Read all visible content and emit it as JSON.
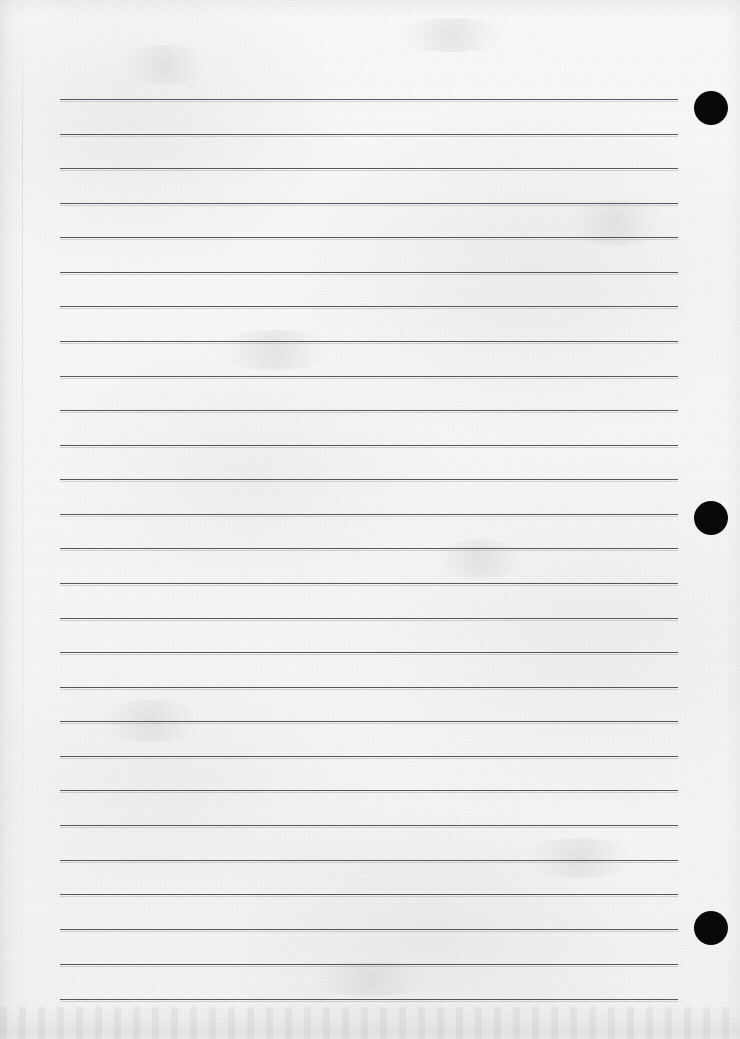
{
  "document": {
    "type": "scanned-ruled-notebook-page",
    "title": "Blank Ruled Page",
    "page_width": 740,
    "page_height": 1039,
    "has_text_content": false,
    "content_text": "",
    "paper_color": "#f6f6f4",
    "rule_color": "#474a50",
    "marker_color": "#080808",
    "background_color": "#ffffff"
  },
  "ruling": {
    "label": "Ruled writing lines",
    "line_count": 27,
    "first_line_y": 99,
    "line_spacing": 34.6,
    "line_left_x": 60,
    "line_right_x": 678,
    "line_thickness": 1.4,
    "lines": [
      {
        "index": 1,
        "y": 99,
        "x1": 60,
        "x2": 678
      },
      {
        "index": 2,
        "y": 134,
        "x1": 60,
        "x2": 678
      },
      {
        "index": 3,
        "y": 168,
        "x1": 60,
        "x2": 678
      },
      {
        "index": 4,
        "y": 203,
        "x1": 60,
        "x2": 678
      },
      {
        "index": 5,
        "y": 237,
        "x1": 60,
        "x2": 678
      },
      {
        "index": 6,
        "y": 272,
        "x1": 60,
        "x2": 678
      },
      {
        "index": 7,
        "y": 306,
        "x1": 60,
        "x2": 678
      },
      {
        "index": 8,
        "y": 341,
        "x1": 60,
        "x2": 678
      },
      {
        "index": 9,
        "y": 376,
        "x1": 60,
        "x2": 678
      },
      {
        "index": 10,
        "y": 410,
        "x1": 60,
        "x2": 678
      },
      {
        "index": 11,
        "y": 445,
        "x1": 60,
        "x2": 678
      },
      {
        "index": 12,
        "y": 479,
        "x1": 60,
        "x2": 678
      },
      {
        "index": 13,
        "y": 514,
        "x1": 60,
        "x2": 678
      },
      {
        "index": 14,
        "y": 548,
        "x1": 60,
        "x2": 678
      },
      {
        "index": 15,
        "y": 583,
        "x1": 60,
        "x2": 678
      },
      {
        "index": 16,
        "y": 618,
        "x1": 60,
        "x2": 678
      },
      {
        "index": 17,
        "y": 652,
        "x1": 60,
        "x2": 678
      },
      {
        "index": 18,
        "y": 687,
        "x1": 60,
        "x2": 678
      },
      {
        "index": 19,
        "y": 721,
        "x1": 60,
        "x2": 678
      },
      {
        "index": 20,
        "y": 756,
        "x1": 60,
        "x2": 678
      },
      {
        "index": 21,
        "y": 790,
        "x1": 60,
        "x2": 678
      },
      {
        "index": 22,
        "y": 825,
        "x1": 60,
        "x2": 678
      },
      {
        "index": 23,
        "y": 860,
        "x1": 60,
        "x2": 678
      },
      {
        "index": 24,
        "y": 894,
        "x1": 60,
        "x2": 678
      },
      {
        "index": 25,
        "y": 929,
        "x1": 60,
        "x2": 678
      },
      {
        "index": 26,
        "y": 964,
        "x1": 60,
        "x2": 678
      },
      {
        "index": 27,
        "y": 999,
        "x1": 60,
        "x2": 678
      }
    ]
  },
  "markers": {
    "label": "Black binder hole marks",
    "count": 3,
    "radius": 17,
    "color": "#080808",
    "dots": [
      {
        "index": 1,
        "cx": 711,
        "cy": 108,
        "r": 17
      },
      {
        "index": 2,
        "cx": 711,
        "cy": 518,
        "r": 17
      },
      {
        "index": 3,
        "cx": 711,
        "cy": 928,
        "r": 17
      }
    ]
  },
  "artifacts": {
    "label": "Scan artifacts",
    "left_edge_shadow": true,
    "left_crease_x": 22,
    "top_edge_shadow": true,
    "bottom_dirty_band": true,
    "bottom_band_height": 32,
    "smudges": [
      {
        "x": 120,
        "y": 45,
        "w": 90,
        "h": 40
      },
      {
        "x": 392,
        "y": 18,
        "w": 120,
        "h": 34
      },
      {
        "x": 560,
        "y": 200,
        "w": 110,
        "h": 46
      },
      {
        "x": 210,
        "y": 330,
        "w": 130,
        "h": 40
      },
      {
        "x": 430,
        "y": 540,
        "w": 100,
        "h": 38
      },
      {
        "x": 96,
        "y": 700,
        "w": 110,
        "h": 42
      },
      {
        "x": 520,
        "y": 838,
        "w": 120,
        "h": 40
      },
      {
        "x": 300,
        "y": 962,
        "w": 140,
        "h": 34
      }
    ]
  }
}
